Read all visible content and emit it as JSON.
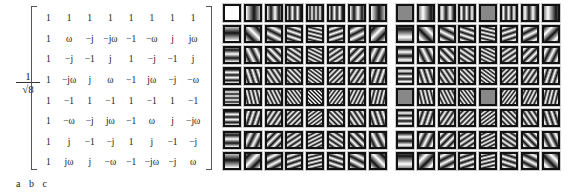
{
  "figure": {
    "scale_factor": {
      "numerator": "1",
      "denominator": "√8"
    },
    "matrix": [
      [
        "1",
        "1",
        "1",
        "1",
        "1",
        "1",
        "1",
        "1"
      ],
      [
        "1",
        "ω",
        "−j",
        "−jω",
        "−1",
        "−ω",
        "j",
        "jω"
      ],
      [
        "1",
        "−j",
        "−1",
        "j",
        "1",
        "−j",
        "−1",
        "j"
      ],
      [
        "1",
        "−jω",
        "j",
        "ω",
        "−1",
        "jω",
        "−j",
        "−ω"
      ],
      [
        "1",
        "−1",
        "1",
        "−1",
        "1",
        "−1",
        "1",
        "−1"
      ],
      [
        "1",
        "−ω",
        "−j",
        "jω",
        "−1",
        "ω",
        "j",
        "−jω"
      ],
      [
        "1",
        "j",
        "−1",
        "−j",
        "1",
        "j",
        "−1",
        "−j"
      ],
      [
        "1",
        "jω",
        "j",
        "−ω",
        "−1",
        "−jω",
        "−j",
        "ω"
      ]
    ],
    "panel_labels": "a b c",
    "basis_grid_b": {
      "rows": 8,
      "cols": 8,
      "description": "real part basis images"
    },
    "basis_grid_c": {
      "rows": 8,
      "cols": 8,
      "description": "imaginary part basis images"
    }
  }
}
